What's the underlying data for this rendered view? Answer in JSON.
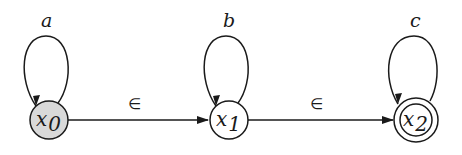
{
  "diagram": {
    "type": "finite-state-automaton",
    "colors": {
      "stroke": "#1a1a1a",
      "initial_fill": "#d9d9d9",
      "state_fill": "#ffffff"
    },
    "states": [
      {
        "id": "x0",
        "base": "x",
        "sub": "0",
        "shaded": true,
        "accepting": false,
        "loop_label": "a"
      },
      {
        "id": "x1",
        "base": "x",
        "sub": "1",
        "shaded": false,
        "accepting": false,
        "loop_label": "b"
      },
      {
        "id": "x2",
        "base": "x",
        "sub": "2",
        "shaded": false,
        "accepting": true,
        "loop_label": "c"
      }
    ],
    "transitions": [
      {
        "from": "x0",
        "to": "x0",
        "label": "a"
      },
      {
        "from": "x1",
        "to": "x1",
        "label": "b"
      },
      {
        "from": "x2",
        "to": "x2",
        "label": "c"
      },
      {
        "from": "x0",
        "to": "x1",
        "label": "∈"
      },
      {
        "from": "x1",
        "to": "x2",
        "label": "∈"
      }
    ]
  }
}
